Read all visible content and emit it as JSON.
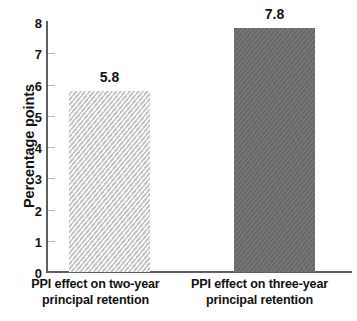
{
  "chart_data": {
    "type": "bar",
    "title": "",
    "subtitle": "",
    "xlabel": "",
    "ylabel": "Percentage points",
    "ylim": [
      0,
      8
    ],
    "ytick_step": 1,
    "grid": false,
    "legend": "none",
    "categories": [
      "PPI effect on two-year principal retention",
      "PPI effect on three-year principal retention"
    ],
    "category_lines": [
      [
        "PPI effect on two-year",
        "principal retention"
      ],
      [
        "PPI effect on three-year",
        "principal retention"
      ]
    ],
    "values": [
      5.8,
      7.8
    ],
    "value_labels": [
      "5.8",
      "7.8"
    ],
    "ytick_labels": [
      "8",
      "7",
      "6",
      "5",
      "4",
      "3",
      "2",
      "1",
      "0"
    ],
    "ytick_values": [
      8,
      7,
      6,
      5,
      4,
      3,
      2,
      1,
      0
    ],
    "bar_colors": [
      "#dcdcdc",
      "#6e6e6e"
    ],
    "bar_styles": [
      "diagonal-hatch-light",
      "solid-dark"
    ],
    "axis_color": "#5f5f5f",
    "text_color": "#121212"
  },
  "footnote": {
    "cut_off_text": " "
  }
}
